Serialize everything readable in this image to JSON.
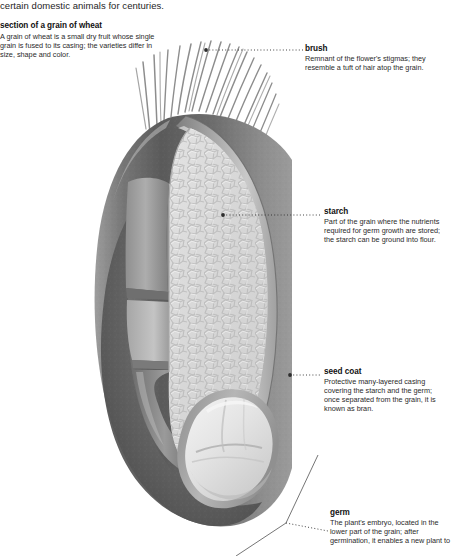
{
  "page": {
    "running_text": "certain domestic animals for centuries."
  },
  "intro": {
    "title": "section of a grain of wheat",
    "body": "A grain of wheat is a small dry fruit whose single grain is fused to its casing; the varieties differ in size, shape and color."
  },
  "callouts": [
    {
      "id": "brush",
      "title": "brush",
      "body": "Remnant of the flower's stigmas; they resemble a tuft of hair atop the grain."
    },
    {
      "id": "starch",
      "title": "starch",
      "body": "Part of the grain where the nutrients required for germ growth are stored; the starch can be ground into flour."
    },
    {
      "id": "seed-coat",
      "title": "seed coat",
      "body": "Protective many-layered casing covering the starch and the germ; once separated from the grain, it is known as bran."
    },
    {
      "id": "germ",
      "title": "germ",
      "body": "The plant's embryo, located in the lower part of the grain; after germination, it enables a new plant to"
    }
  ],
  "diagram": {
    "colors": {
      "hull_dark": "#5d5d5d",
      "hull_mid": "#8a8a8a",
      "hull_light": "#b4b4b4",
      "seed_coat": "#9a9a9a",
      "seed_coat_inner": "#c6c6c6",
      "starch": "#dcdcdc",
      "starch_cell_line": "#b8b8b8",
      "germ": "#e2e2e2",
      "brush_hair": "#8c8c8c",
      "leader_line": "#3a3a3a",
      "background": "#ffffff"
    },
    "parts": [
      "brush",
      "seed coat",
      "starch",
      "germ"
    ],
    "brush_hair_count": 22
  }
}
